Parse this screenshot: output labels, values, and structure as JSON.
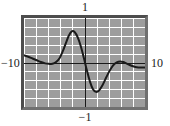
{
  "figure": {
    "kind": "graphing-calculator-plot",
    "background_color": "#ffffff",
    "frame_border_color": "#4d4d4d",
    "plot_background_color": "#9d9d9d",
    "grid_color": "#ffffff",
    "axis_color": "#1a1a1a",
    "curve_color": "#1a1a1a"
  },
  "labels": {
    "top": "1",
    "bottom": "−1",
    "left": "−10",
    "right": "10"
  },
  "chart_data": {
    "type": "line",
    "title": "",
    "xlabel": "",
    "ylabel": "",
    "xlim": [
      -10,
      10
    ],
    "ylim": [
      -1,
      1
    ],
    "grid": true,
    "grid_x_step": 2,
    "grid_y_step": 0.2,
    "legend": "none",
    "axes": {
      "x_axis_at_y": 0,
      "y_axis_at_x": 0,
      "tick_labels_x": [
        "−10",
        "10"
      ],
      "tick_labels_y": [
        "−1",
        "1"
      ]
    },
    "series": [
      {
        "name": "curve",
        "color": "#1a1a1a",
        "x": [
          -10.0,
          -9.3,
          -8.6,
          -7.9,
          -7.2,
          -6.5,
          -5.9,
          -5.3,
          -4.7,
          -4.1,
          -3.6,
          -3.1,
          -2.6,
          -2.1,
          -1.6,
          -1.1,
          -0.6,
          -0.1,
          0.4,
          0.9,
          1.4,
          1.9,
          2.4,
          2.9,
          3.4,
          3.9,
          4.4,
          4.9,
          5.4,
          5.9,
          6.4,
          6.9,
          7.4,
          7.9,
          8.4,
          8.9,
          9.4,
          10.0
        ],
        "y": [
          0.16,
          0.13,
          0.09,
          0.05,
          0.01,
          -0.02,
          -0.03,
          -0.03,
          0.01,
          0.1,
          0.25,
          0.43,
          0.6,
          0.7,
          0.68,
          0.56,
          0.36,
          0.1,
          -0.18,
          -0.43,
          -0.6,
          -0.66,
          -0.63,
          -0.53,
          -0.39,
          -0.25,
          -0.13,
          -0.04,
          0.01,
          0.02,
          0.01,
          -0.02,
          -0.05,
          -0.08,
          -0.1,
          -0.11,
          -0.11,
          -0.11
        ]
      }
    ],
    "annotations": [
      {
        "text": "1",
        "position": "above-plot-center"
      },
      {
        "text": "−1",
        "position": "below-plot-center"
      },
      {
        "text": "−10",
        "position": "left-of-plot-middle"
      },
      {
        "text": "10",
        "position": "right-of-plot-middle"
      }
    ]
  }
}
